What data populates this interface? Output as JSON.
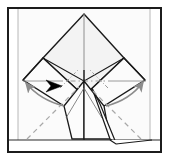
{
  "figure": {
    "canvas": {
      "width": 169,
      "height": 160
    },
    "colors": {
      "background": "#ffffff",
      "paper_fill": "#fafafa",
      "shade_fill": "#f2f2f2",
      "outline": "#1a1a1a",
      "frame": "#1c1c1c",
      "crease_gray": "#9a9a9a",
      "dash_gray": "#a8a8a8",
      "arrow_gray": "#8c8c8c",
      "arrow_black": "#000000"
    },
    "frame": {
      "label": "outer border",
      "x": 7,
      "y": 7,
      "width": 154,
      "height": 145,
      "stroke_width": 2
    },
    "inner_frame": {
      "label": "inner paper edge",
      "x": 18,
      "y": 9,
      "width": 132,
      "height": 131
    },
    "bottom_band": {
      "label": "bottom flap band",
      "y": 140
    },
    "apex": {
      "label": "top point",
      "x": 84,
      "y": 14
    },
    "shoulders": [
      {
        "label": "left shoulder point",
        "x": 43,
        "y": 58
      },
      {
        "label": "right shoulder point",
        "x": 124,
        "y": 58
      }
    ],
    "side_points": [
      {
        "label": "left outer point",
        "x": 23,
        "y": 80
      },
      {
        "label": "right outer point",
        "x": 145,
        "y": 80
      }
    ],
    "center_line": {
      "label": "vertical center crease",
      "x": 84
    },
    "horizontal_crease": {
      "label": "horizontal crease",
      "y": 81
    },
    "arrows": [
      {
        "name": "center-fold-arrow",
        "style": "solid-black",
        "direction": "right",
        "from_x": 50,
        "from_y": 85,
        "to_x": 62,
        "to_y": 85
      },
      {
        "name": "left-fold-arrow",
        "style": "curved-gray",
        "direction": "up-left",
        "from_x": 62,
        "from_y": 104,
        "to_x": 24,
        "to_y": 81
      },
      {
        "name": "right-fold-arrow",
        "style": "curved-gray",
        "direction": "up-right",
        "from_x": 108,
        "from_y": 104,
        "to_x": 144,
        "to_y": 80
      }
    ],
    "dashed_creases": [
      {
        "name": "left-dashed-fold",
        "x1": 27,
        "y1": 139,
        "x2": 78,
        "y2": 88
      },
      {
        "name": "right-dashed-fold",
        "x1": 140,
        "y1": 139,
        "x2": 92,
        "y2": 90
      },
      {
        "name": "center-dashed-crease",
        "x1": 58,
        "y1": 81,
        "x2": 110,
        "y2": 81
      }
    ],
    "caption": ""
  }
}
